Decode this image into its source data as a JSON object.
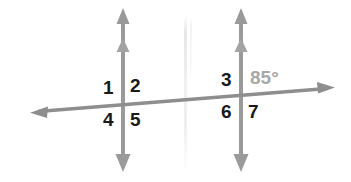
{
  "figure": {
    "background_color": "#ffffff",
    "line_color": "#999999",
    "label_color": "#1a1a1a",
    "measure_color": "#a8a8a8",
    "width": 351,
    "height": 182
  },
  "lines": {
    "vertical_left": {
      "name": "line-m",
      "x": 123,
      "y_top": 10,
      "y_bottom": 170,
      "arrow_top": "double-arrowhead",
      "arrow_bottom": "single-arrowhead"
    },
    "vertical_right": {
      "name": "line-n",
      "x": 241,
      "y_top": 10,
      "y_bottom": 170,
      "arrow_top": "double-arrowhead",
      "arrow_bottom": "single-arrowhead"
    },
    "transversal": {
      "name": "line-t",
      "x1": 32,
      "y1": 112,
      "x2": 333,
      "y2": 88,
      "arrow_start": "single-arrowhead",
      "arrow_end": "single-arrowhead"
    }
  },
  "intersections": {
    "left": {
      "x": 123,
      "y": 104
    },
    "right": {
      "x": 241,
      "y": 97
    }
  },
  "labels": [
    {
      "id": "angle-1",
      "text": "1",
      "x": 103,
      "y": 78,
      "kind": "number"
    },
    {
      "id": "angle-2",
      "text": "2",
      "x": 130,
      "y": 76,
      "kind": "number"
    },
    {
      "id": "angle-4",
      "text": "4",
      "x": 103,
      "y": 110,
      "kind": "number"
    },
    {
      "id": "angle-5",
      "text": "5",
      "x": 130,
      "y": 110,
      "kind": "number"
    },
    {
      "id": "angle-3",
      "text": "3",
      "x": 221,
      "y": 70,
      "kind": "number"
    },
    {
      "id": "angle-6",
      "text": "6",
      "x": 221,
      "y": 102,
      "kind": "number"
    },
    {
      "id": "angle-7",
      "text": "7",
      "x": 248,
      "y": 102,
      "kind": "number"
    },
    {
      "id": "angle-85",
      "text": "85°",
      "x": 250,
      "y": 68,
      "kind": "measure"
    }
  ],
  "label_text": {
    "one": "1",
    "two": "2",
    "three": "3",
    "four": "4",
    "five": "5",
    "six": "6",
    "seven": "7",
    "measure_85": "85°"
  }
}
